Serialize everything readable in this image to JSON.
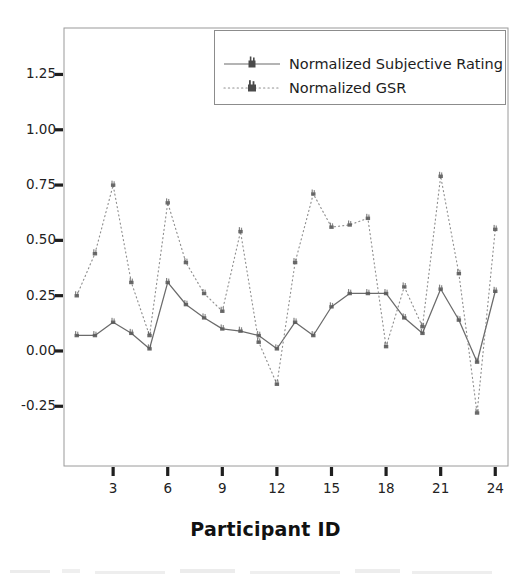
{
  "chart_data": {
    "type": "line",
    "title": "",
    "xlabel": "Participant ID",
    "ylabel": "",
    "grid": false,
    "legend_position": "top-right-inside",
    "x": [
      1,
      2,
      3,
      4,
      5,
      6,
      7,
      8,
      9,
      10,
      11,
      12,
      13,
      14,
      15,
      16,
      17,
      18,
      19,
      20,
      21,
      22,
      23,
      24
    ],
    "xticks": [
      3,
      6,
      9,
      12,
      15,
      18,
      21,
      24
    ],
    "xtick_labels": [
      "3",
      "6",
      "9",
      "12",
      "15",
      "18",
      "21",
      "24"
    ],
    "xlim": [
      0.3,
      24.7
    ],
    "yticks": [
      -0.25,
      0.0,
      0.25,
      0.5,
      0.75,
      1.0,
      1.25
    ],
    "ytick_labels": [
      "-0.25",
      "0.00",
      "0.25",
      "0.50",
      "0.75",
      "1.00",
      "1.25"
    ],
    "ylim": [
      -0.52,
      1.46
    ],
    "series": [
      {
        "name": "Normalized Subjective Rating",
        "linestyle": "solid",
        "marker": "square",
        "color": "#6b6b6b",
        "values": [
          0.07,
          0.07,
          0.13,
          0.08,
          0.01,
          0.31,
          0.21,
          0.15,
          0.1,
          0.09,
          0.07,
          0.01,
          0.13,
          0.07,
          0.2,
          0.26,
          0.26,
          0.26,
          0.15,
          0.08,
          0.28,
          0.14,
          -0.05,
          0.27
        ]
      },
      {
        "name": "Normalized GSR",
        "linestyle": "dotted",
        "marker": "square",
        "color": "#8f8f8f",
        "values": [
          0.25,
          0.44,
          0.75,
          0.31,
          0.07,
          0.67,
          0.4,
          0.26,
          0.18,
          0.54,
          0.04,
          -0.15,
          0.4,
          0.71,
          0.56,
          0.57,
          0.6,
          0.02,
          0.29,
          0.11,
          0.79,
          0.35,
          -0.28,
          0.55
        ]
      }
    ]
  },
  "legend": {
    "items": [
      {
        "label": "Normalized Subjective Rating"
      },
      {
        "label": "Normalized GSR"
      }
    ]
  },
  "axes": {
    "x_title": "Participant ID"
  }
}
